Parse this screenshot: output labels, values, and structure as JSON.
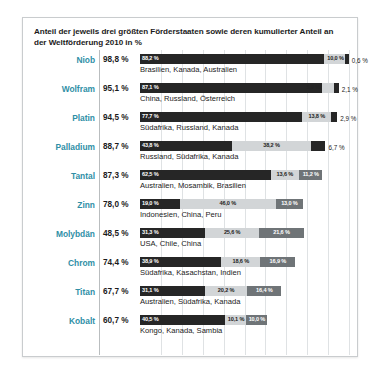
{
  "chart_data": {
    "type": "bar",
    "title": "Anteil der jeweils drei größten Förderstaaten sowie deren kumulierter Anteil an der Weltförderung 2010 in %",
    "xlabel": "",
    "ylabel": "",
    "xlim": [
      0,
      100
    ],
    "grid": true,
    "grid_step": 10,
    "legend": "none",
    "stacked": true,
    "unit": "%",
    "categories": [
      "Niob",
      "Wolfram",
      "Platin",
      "Palladium",
      "Tantal",
      "Zinn",
      "Molybdän",
      "Chrom",
      "Titan",
      "Kobalt"
    ],
    "totals": [
      98.8,
      95.1,
      94.5,
      88.7,
      87.3,
      78.0,
      48.5,
      74.4,
      67.7,
      60.7
    ],
    "series": [
      {
        "name": "Größter Förderstaat",
        "values": [
          88.2,
          87.1,
          77.7,
          43.8,
          62.5,
          19.0,
          31.3,
          38.9,
          31.1,
          40.5
        ]
      },
      {
        "name": "Zweitgrößter Förderstaat",
        "values": [
          10.0,
          5.9,
          13.8,
          38.2,
          13.6,
          46.0,
          25.6,
          18.6,
          20.2,
          10.1
        ]
      },
      {
        "name": "Drittgrößter Förderstaat",
        "values": [
          0.6,
          2.1,
          2.9,
          6.7,
          11.2,
          13.0,
          21.6,
          16.9,
          16.4,
          10.0
        ]
      }
    ],
    "country_lists": [
      "Brasilien, Kanada, Australien",
      "China, Russland, Österreich",
      "Südafrika, Russland, Kanada",
      "Russland, Südafrika, Kanada",
      "Australien, Mosambik, Brasilien",
      "Indonesien, China, Peru",
      "USA, Chile, China",
      "Südafrika, Kasachstan, Indien",
      "Australien, Südafrika, Kanada",
      "Kongo, Kanada, Sambia"
    ]
  },
  "rows": [
    {
      "name": "Niob",
      "total": "98,8 %",
      "countries": "Brasilien, Kanada, Australien",
      "s1": {
        "v": 88.2,
        "label": "88,2 %"
      },
      "s2": {
        "v": 10.0,
        "label": "10,0 %"
      },
      "s3": {
        "v": 0.6,
        "label": "0,6 %",
        "outside": true
      }
    },
    {
      "name": "Wolfram",
      "total": "95,1 %",
      "countries": "China, Russland, Österreich",
      "s1": {
        "v": 87.1,
        "label": "87,1 %"
      },
      "s2": {
        "v": 5.9,
        "label": "5,9 %",
        "outsideLeft": true
      },
      "s3": {
        "v": 2.1,
        "label": "2,1 %",
        "outside": true
      }
    },
    {
      "name": "Platin",
      "total": "94,5 %",
      "countries": "Südafrika, Russland, Kanada",
      "s1": {
        "v": 77.7,
        "label": "77,7 %"
      },
      "s2": {
        "v": 13.8,
        "label": "13,8 %"
      },
      "s3": {
        "v": 2.9,
        "label": "2,9 %",
        "outside": true
      }
    },
    {
      "name": "Palladium",
      "total": "88,7 %",
      "countries": "Russland, Südafrika, Kanada",
      "s1": {
        "v": 43.8,
        "label": "43,8 %"
      },
      "s2": {
        "v": 38.2,
        "label": "38,2 %"
      },
      "s3": {
        "v": 6.7,
        "label": "6,7 %",
        "outside": true
      }
    },
    {
      "name": "Tantal",
      "total": "87,3 %",
      "countries": "Australien, Mosambik, Brasilien",
      "s1": {
        "v": 62.5,
        "label": "62,5 %"
      },
      "s2": {
        "v": 13.6,
        "label": "13,6 %"
      },
      "s3": {
        "v": 11.2,
        "label": "11,2 %"
      }
    },
    {
      "name": "Zinn",
      "total": "78,0 %",
      "countries": "Indonesien, China, Peru",
      "s1": {
        "v": 19.0,
        "label": "19,0 %"
      },
      "s2": {
        "v": 46.0,
        "label": "46,0 %"
      },
      "s3": {
        "v": 13.0,
        "label": "13,0 %"
      }
    },
    {
      "name": "Molybdän",
      "total": "48,5 %",
      "countries": "USA, Chile, China",
      "s1": {
        "v": 31.3,
        "label": "31,3 %"
      },
      "s2": {
        "v": 25.6,
        "label": "25,6 %"
      },
      "s3": {
        "v": 21.6,
        "label": "21,6 %"
      }
    },
    {
      "name": "Chrom",
      "total": "74,4 %",
      "countries": "Südafrika, Kasachstan, Indien",
      "s1": {
        "v": 38.9,
        "label": "38,9 %"
      },
      "s2": {
        "v": 18.6,
        "label": "18,6 %"
      },
      "s3": {
        "v": 16.9,
        "label": "16,9 %"
      }
    },
    {
      "name": "Titan",
      "total": "67,7 %",
      "countries": "Australien, Südafrika, Kanada",
      "s1": {
        "v": 31.1,
        "label": "31,1 %"
      },
      "s2": {
        "v": 20.2,
        "label": "20,2 %"
      },
      "s3": {
        "v": 16.4,
        "label": "16,4 %"
      }
    },
    {
      "name": "Kobalt",
      "total": "60,7 %",
      "countries": "Kongo, Kanada, Sambia",
      "s1": {
        "v": 40.5,
        "label": "40,5 %"
      },
      "s2": {
        "v": 10.1,
        "label": "10,1 %"
      },
      "s3": {
        "v": 10.0,
        "label": "10,0 %"
      }
    }
  ],
  "colors": {
    "series1": "#262626",
    "series2": "#d2d5d7",
    "series3": "#6f7477",
    "element_label": "#2f8fa6",
    "grid": "#dfe2e4",
    "border": "#c9ccce",
    "text": "#1b1b1b"
  },
  "gridlines": [
    10,
    20,
    30,
    40,
    50,
    60,
    70,
    80,
    90,
    100
  ]
}
